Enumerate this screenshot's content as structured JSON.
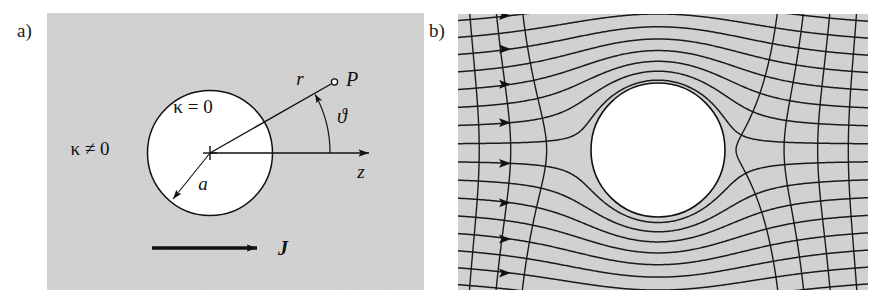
{
  "figure": {
    "type": "scientific-diagram",
    "background_color": "#ffffff",
    "panel_fill_color": "#d2d2d2",
    "line_color": "#111111"
  },
  "panels": [
    {
      "id": "a",
      "label": "a)",
      "label_x": 17,
      "label_y": 20,
      "rect": {
        "x": 47,
        "y": 13,
        "width": 377,
        "height": 277
      },
      "annotations": {
        "outer_medium": "κ ≠ 0",
        "inner_region": "κ = 0",
        "radius_label": "a",
        "radial_coord_label": "r",
        "angle_label": "ϑ",
        "axis_label": "z",
        "point_label": "P",
        "current_label": "J"
      },
      "circle": {
        "cx": 163,
        "cy": 140,
        "r": 62.5
      },
      "center_marker": "cross",
      "axis_arrow": {
        "from_x": 163,
        "from_y": 140,
        "to_x": 333,
        "to_y": 140
      },
      "radius_arrow": {
        "from_x": 163,
        "from_y": 140,
        "to_x": 131,
        "to_y": 180
      },
      "r_ray": {
        "from_x": 163,
        "from_y": 140,
        "to_x": 288,
        "to_y": 69
      },
      "point_marker": {
        "cx": 288,
        "cy": 69,
        "r": 3
      },
      "angle_arc": {
        "cx": 163,
        "cy": 140,
        "radius": 120,
        "start_deg": 0,
        "end_deg": 29.6
      },
      "current_arrow": {
        "from_x": 105,
        "from_y": 235,
        "to_x": 218,
        "to_y": 235
      }
    },
    {
      "id": "b",
      "label": "b)",
      "label_x": 429,
      "label_y": 20,
      "rect": {
        "x": 458,
        "y": 14,
        "width": 410,
        "height": 276
      },
      "description": "Streamline / equipotential mesh deflected around an insulating circular inclusion, with flow-direction arrowheads on the left edge.",
      "circle": {
        "cx": 200,
        "cy": 136,
        "r": 67
      },
      "streamline_count": 18,
      "equipotential_count": 19,
      "arrowhead_count": 9,
      "arrowhead_x": 52,
      "flow_direction": "left-to-right"
    }
  ],
  "chart_data": {
    "type": "diagram",
    "title": "",
    "panel_a": {
      "geometry": "sphere of radius a with κ = 0 embedded in medium with κ ≠ 0",
      "coordinates": [
        "r",
        "ϑ",
        "z"
      ],
      "field_symbol": "J",
      "observation_point": "P"
    },
    "panel_b": {
      "field_type": "current density streamlines and equipotentials",
      "obstacle": "insulating circle",
      "uniform_far_field": true
    }
  }
}
